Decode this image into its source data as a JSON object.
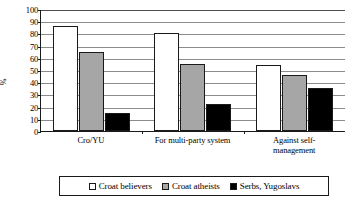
{
  "chart_data": {
    "type": "bar",
    "title": "",
    "subtitle": "",
    "xlabel": "",
    "ylabel": "%",
    "ylim": [
      0,
      100
    ],
    "ytick_step": 10,
    "yticks": [
      100,
      90,
      80,
      70,
      60,
      50,
      40,
      30,
      20,
      10,
      0
    ],
    "grid": true,
    "legend_position": "bottom",
    "categories": [
      "Cro/YU",
      "For multi-party system",
      "Against self-management"
    ],
    "category_label_lines": [
      [
        "Cro/YU"
      ],
      [
        "For multi-party system"
      ],
      [
        "Against self-",
        "management"
      ]
    ],
    "series": [
      {
        "name": "Croat believers",
        "color": "#ffffff",
        "values": [
          86,
          80,
          54
        ]
      },
      {
        "name": "Croat atheists",
        "color": "#a6a6a6",
        "values": [
          65,
          55,
          46
        ]
      },
      {
        "name": "Serbs, Yugoslavs",
        "color": "#000000",
        "values": [
          15,
          22,
          35
        ]
      }
    ]
  },
  "legend": {
    "items": [
      {
        "label": "Croat believers",
        "swatch": "white-square-swatch"
      },
      {
        "label": "Croat atheists",
        "swatch": "gray-square-swatch"
      },
      {
        "label": "Serbs, Yugoslavs",
        "swatch": "black-square-swatch"
      }
    ]
  },
  "axis": {
    "y_title": "%"
  }
}
